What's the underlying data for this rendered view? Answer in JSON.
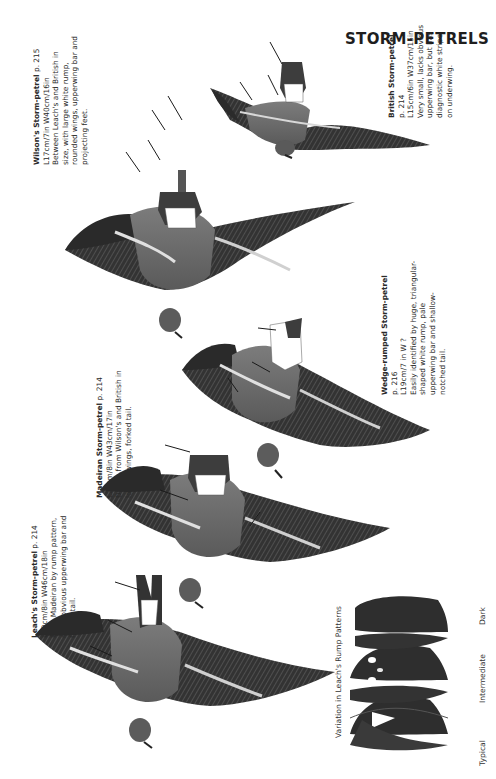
{
  "page": {
    "title": "STORM-PETRELS",
    "background": "#ffffff"
  },
  "species": [
    {
      "id": "british",
      "name": "British Storm-petrel",
      "page_ref": "p. 214",
      "measurements": "L15cm/6in W37cm/15in",
      "description": [
        "Very small, lacks obvious",
        "upperwing bar, but has",
        "diagnostic white stripe",
        "on underwing."
      ]
    },
    {
      "id": "wilsons",
      "name": "Wilson's Storm-petrel",
      "page_ref": "p. 215",
      "measurements": "L17cm/7in W40cm/16in",
      "description": [
        "Between Leach's and British in",
        "size, with large white rump,",
        "rounded wings, upperwing bar and",
        "projecting feet."
      ]
    },
    {
      "id": "wedge-rumped",
      "name": "Wedge-rumped Storm-petrel",
      "page_ref": "p. 216",
      "measurements": "L19cm/7 in W ?",
      "description": [
        "Easily identified by huge, triangular-",
        "shaped white rump, pale",
        "upperwing bar and shallow-",
        "notched tail."
      ]
    },
    {
      "id": "madeiran",
      "name": "Madeiran Storm-petrel",
      "page_ref": "p. 214",
      "measurements": "L20cm/8in W43cm/17in",
      "description": [
        "Differs from Wilson's and British in",
        "longer wings, forked tail."
      ]
    },
    {
      "id": "leachs",
      "name": "Leach's Storm-petrel",
      "page_ref": "p. 214",
      "measurements": "L20cm/8in W46cm/18in",
      "description": [
        "From Madeiran by rump pattern,",
        "more obvious upperwing bar and",
        "fork to tail."
      ]
    }
  ],
  "inset": {
    "caption": "Variation in Leach's Rump Patterns",
    "patterns": [
      "Typical",
      "Intermediate",
      "Dark"
    ]
  },
  "colors": {
    "ink": "#1a1a1a",
    "plumage_dark": "#3a3a3a",
    "plumage_mid": "#8a8a8a",
    "rump_white": "#ffffff"
  }
}
